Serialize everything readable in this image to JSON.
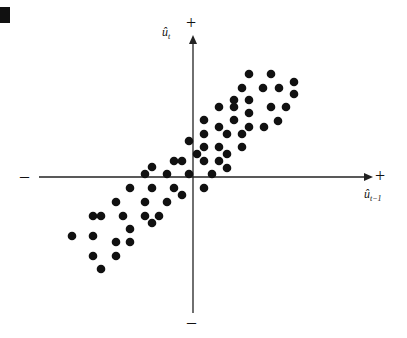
{
  "marker": {
    "color": "#111111"
  },
  "axes": {
    "y_label_base": "û",
    "y_label_sub": "t",
    "x_label_base": "û",
    "x_label_sub": "t−1",
    "plus_sign": "+",
    "minus_sign": "–",
    "color": "#222222"
  },
  "chart_data": {
    "type": "scatter",
    "title": "",
    "xlabel": "û_{t-1}",
    "ylabel": "û_t",
    "grid": false,
    "legend": null,
    "axis_type": "origin-centered, unlabeled ticks (+/− directions only)",
    "origin_px": [
      193,
      177
    ],
    "units": "pixel offsets from origin (x right, y up)",
    "annotation": "Positive autocorrelation: points cluster in quadrants I and III",
    "points": [
      [
        56,
        103
      ],
      [
        78,
        103
      ],
      [
        101,
        95
      ],
      [
        49,
        89
      ],
      [
        70,
        89
      ],
      [
        86,
        89
      ],
      [
        101,
        83
      ],
      [
        41,
        77
      ],
      [
        56,
        77
      ],
      [
        26,
        70
      ],
      [
        41,
        70
      ],
      [
        78,
        70
      ],
      [
        93,
        70
      ],
      [
        56,
        64
      ],
      [
        11,
        57
      ],
      [
        41,
        57
      ],
      [
        85,
        56
      ],
      [
        26,
        50
      ],
      [
        56,
        50
      ],
      [
        71,
        50
      ],
      [
        11,
        43
      ],
      [
        34,
        43
      ],
      [
        49,
        43
      ],
      [
        -4,
        36
      ],
      [
        11,
        30
      ],
      [
        26,
        30
      ],
      [
        49,
        30
      ],
      [
        4,
        23
      ],
      [
        34,
        23
      ],
      [
        -19,
        16
      ],
      [
        -11,
        16
      ],
      [
        11,
        16
      ],
      [
        26,
        16
      ],
      [
        -41,
        10
      ],
      [
        34,
        9
      ],
      [
        -48,
        3
      ],
      [
        -26,
        3
      ],
      [
        -4,
        3
      ],
      [
        19,
        3
      ],
      [
        -63,
        -11
      ],
      [
        -41,
        -11
      ],
      [
        -19,
        -11
      ],
      [
        11,
        -11
      ],
      [
        -11,
        -18
      ],
      [
        -77,
        -25
      ],
      [
        -48,
        -25
      ],
      [
        -26,
        -25
      ],
      [
        -100,
        -39
      ],
      [
        -92,
        -39
      ],
      [
        -70,
        -39
      ],
      [
        -48,
        -39
      ],
      [
        -34,
        -39
      ],
      [
        -41,
        -46
      ],
      [
        -63,
        -52
      ],
      [
        -121,
        -59
      ],
      [
        -100,
        -59
      ],
      [
        -77,
        -65
      ],
      [
        -63,
        -65
      ],
      [
        -100,
        -79
      ],
      [
        -77,
        -79
      ],
      [
        -92,
        -92
      ]
    ],
    "point_color": "#111111",
    "point_radius": 4.3
  }
}
